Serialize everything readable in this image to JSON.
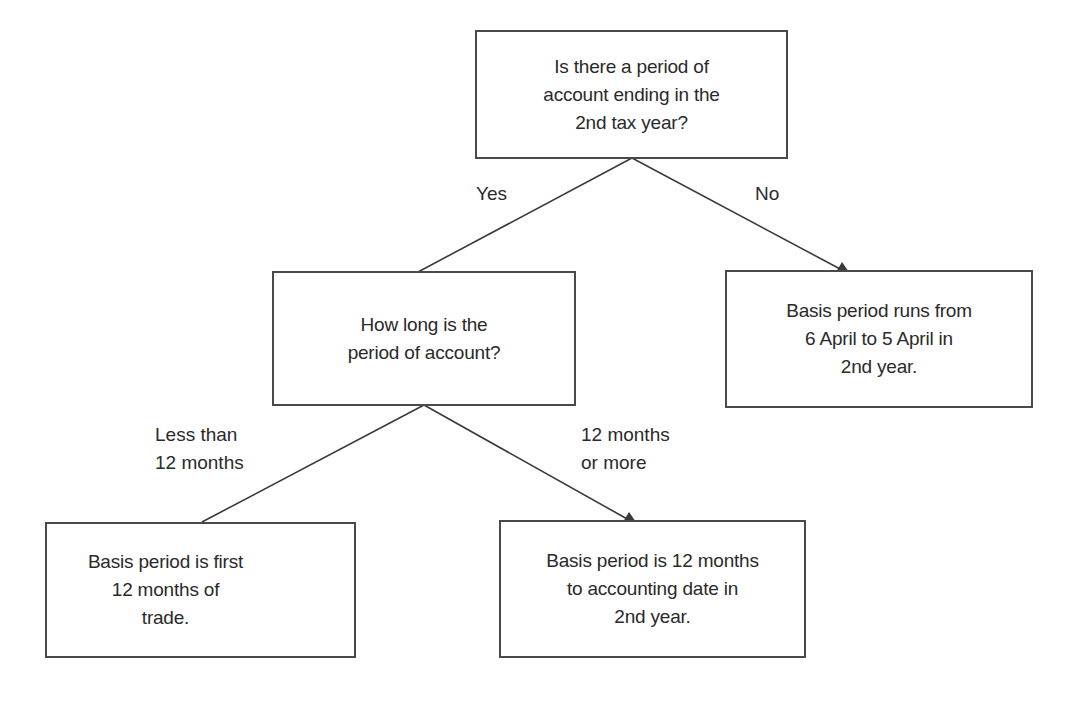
{
  "nodes": {
    "root": {
      "lines": [
        "Is there a period of",
        "account ending in the",
        "2nd tax year?"
      ]
    },
    "length_question": {
      "lines": [
        "How long is the",
        "period of account?"
      ]
    },
    "no_result": {
      "lines": [
        "Basis period runs from",
        "6 April to 5 April in",
        "2nd year."
      ]
    },
    "short_result": {
      "lines": [
        "Basis period is first",
        "12 months of",
        "trade."
      ]
    },
    "long_result": {
      "lines": [
        "Basis period is 12 months",
        "to accounting date in",
        "2nd year."
      ]
    }
  },
  "edges": {
    "yes": {
      "lines": [
        "Yes"
      ]
    },
    "no": {
      "lines": [
        "No"
      ]
    },
    "less_than": {
      "lines": [
        "Less than",
        "12 months"
      ]
    },
    "more_than": {
      "lines": [
        "12 months",
        "or more"
      ]
    }
  },
  "colors": {
    "line": "#3a3a3a",
    "border": "#4a4a4a",
    "text": "#2a2a2a"
  }
}
